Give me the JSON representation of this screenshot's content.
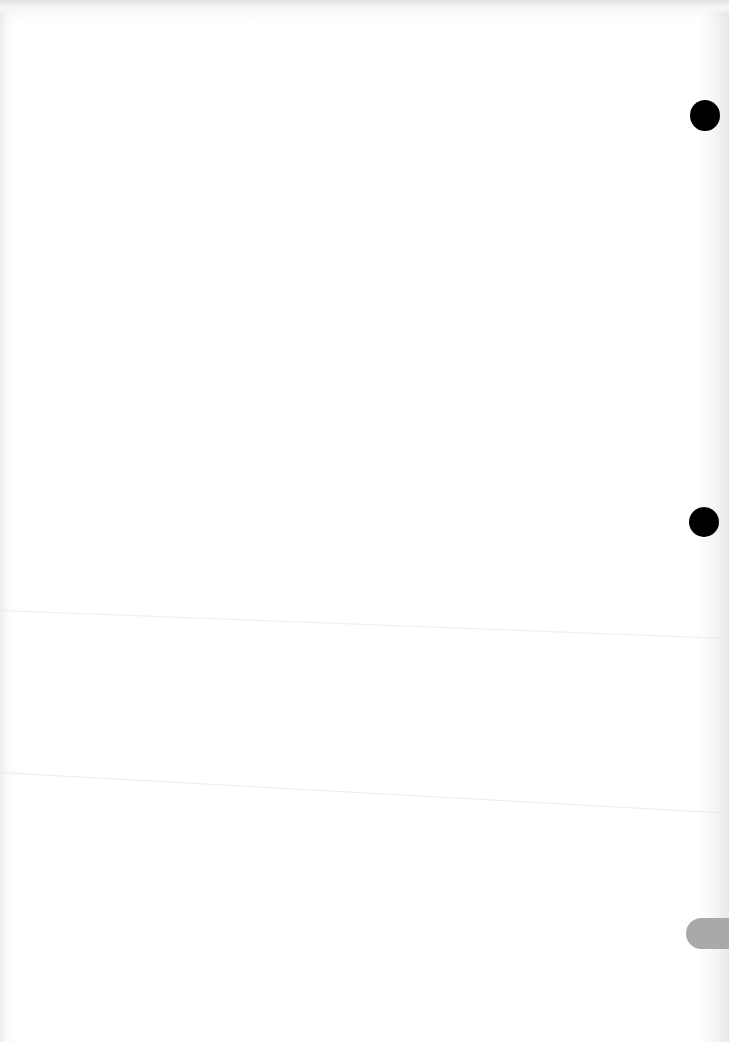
{
  "document": {
    "type": "scanned-blank-page",
    "text_content": "",
    "background_color": "#ffffff",
    "punch_holes": [
      {
        "position": "top-right",
        "color": "#000000"
      },
      {
        "position": "middle-right",
        "color": "#000000"
      }
    ],
    "edge_tab": {
      "position": "bottom-right",
      "color": "#a9a9a9"
    }
  }
}
